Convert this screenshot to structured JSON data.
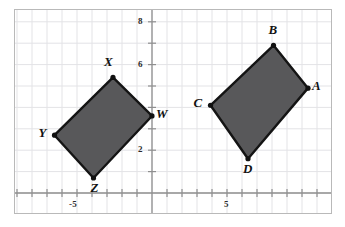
{
  "figure": {
    "background_color": "#ffffff",
    "frame_color": "#b9b9b9",
    "grid_color": "#e3e3e6",
    "axis_color": "#8f8f8f",
    "shape_fill": "#58585a",
    "shape_stroke": "#141414",
    "vertex_dot_color": "#111111"
  },
  "axes": {
    "x_axis_label": "",
    "y_axis_label": "",
    "xlim": [
      -8.1,
      12.3
    ],
    "ylim": [
      -1.6,
      8.9
    ],
    "tick_interval": 1,
    "grid": true,
    "x_tick_labels": [
      {
        "value": -5,
        "text": "-5"
      },
      {
        "value": 5,
        "text": "5"
      }
    ],
    "y_tick_labels": [
      {
        "value": 2,
        "text": "2"
      },
      {
        "value": 6,
        "text": "6"
      },
      {
        "value": 8,
        "text": "8"
      }
    ]
  },
  "chart_data": {
    "type": "scatter",
    "title": "",
    "xlabel": "",
    "ylabel": "",
    "xlim": [
      -8.1,
      12.3
    ],
    "ylim": [
      -1.6,
      8.9
    ],
    "grid": true,
    "legend": "none",
    "series": [
      {
        "name": "Quadrilateral WXYZ",
        "closed": true,
        "fill": "#58585a",
        "stroke": "#141414",
        "points": [
          {
            "label": "W",
            "x": 0.0,
            "y": 3.6,
            "label_pos": "right"
          },
          {
            "label": "X",
            "x": -2.6,
            "y": 5.4,
            "label_pos": "above-left"
          },
          {
            "label": "Y",
            "x": -6.5,
            "y": 2.7,
            "label_pos": "left"
          },
          {
            "label": "Z",
            "x": -3.9,
            "y": 0.7,
            "label_pos": "below-right"
          }
        ]
      },
      {
        "name": "Quadrilateral ABCD",
        "closed": true,
        "fill": "#58585a",
        "stroke": "#141414",
        "points": [
          {
            "label": "A",
            "x": 10.4,
            "y": 4.9,
            "label_pos": "right"
          },
          {
            "label": "B",
            "x": 8.1,
            "y": 6.9,
            "label_pos": "above"
          },
          {
            "label": "C",
            "x": 3.9,
            "y": 4.1,
            "label_pos": "left"
          },
          {
            "label": "D",
            "x": 6.4,
            "y": 1.6,
            "label_pos": "below"
          }
        ]
      }
    ]
  },
  "labels": {
    "W": "W",
    "X": "X",
    "Y": "Y",
    "Z": "Z",
    "A": "A",
    "B": "B",
    "C": "C",
    "D": "D",
    "x_neg5": "-5",
    "x_pos5": "5",
    "y_2": "2",
    "y_6": "6",
    "y_8": "8"
  }
}
